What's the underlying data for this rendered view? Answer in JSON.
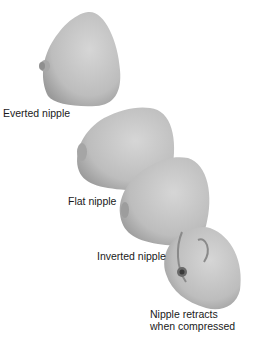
{
  "figure": {
    "type": "anatomical-illustration",
    "colors": {
      "skin": "#b9b9b9",
      "skin_light": "#d4d4d4",
      "skin_dark": "#8c8c8c",
      "text": "#1a1a1a"
    },
    "labels": [
      {
        "id": "everted",
        "text": "Everted nipple"
      },
      {
        "id": "flat",
        "text": "Flat nipple"
      },
      {
        "id": "inverted",
        "text": "Inverted nipple"
      },
      {
        "id": "retracts_1",
        "text": "Nipple retracts"
      },
      {
        "id": "retracts_2",
        "text": "when compressed"
      }
    ]
  }
}
